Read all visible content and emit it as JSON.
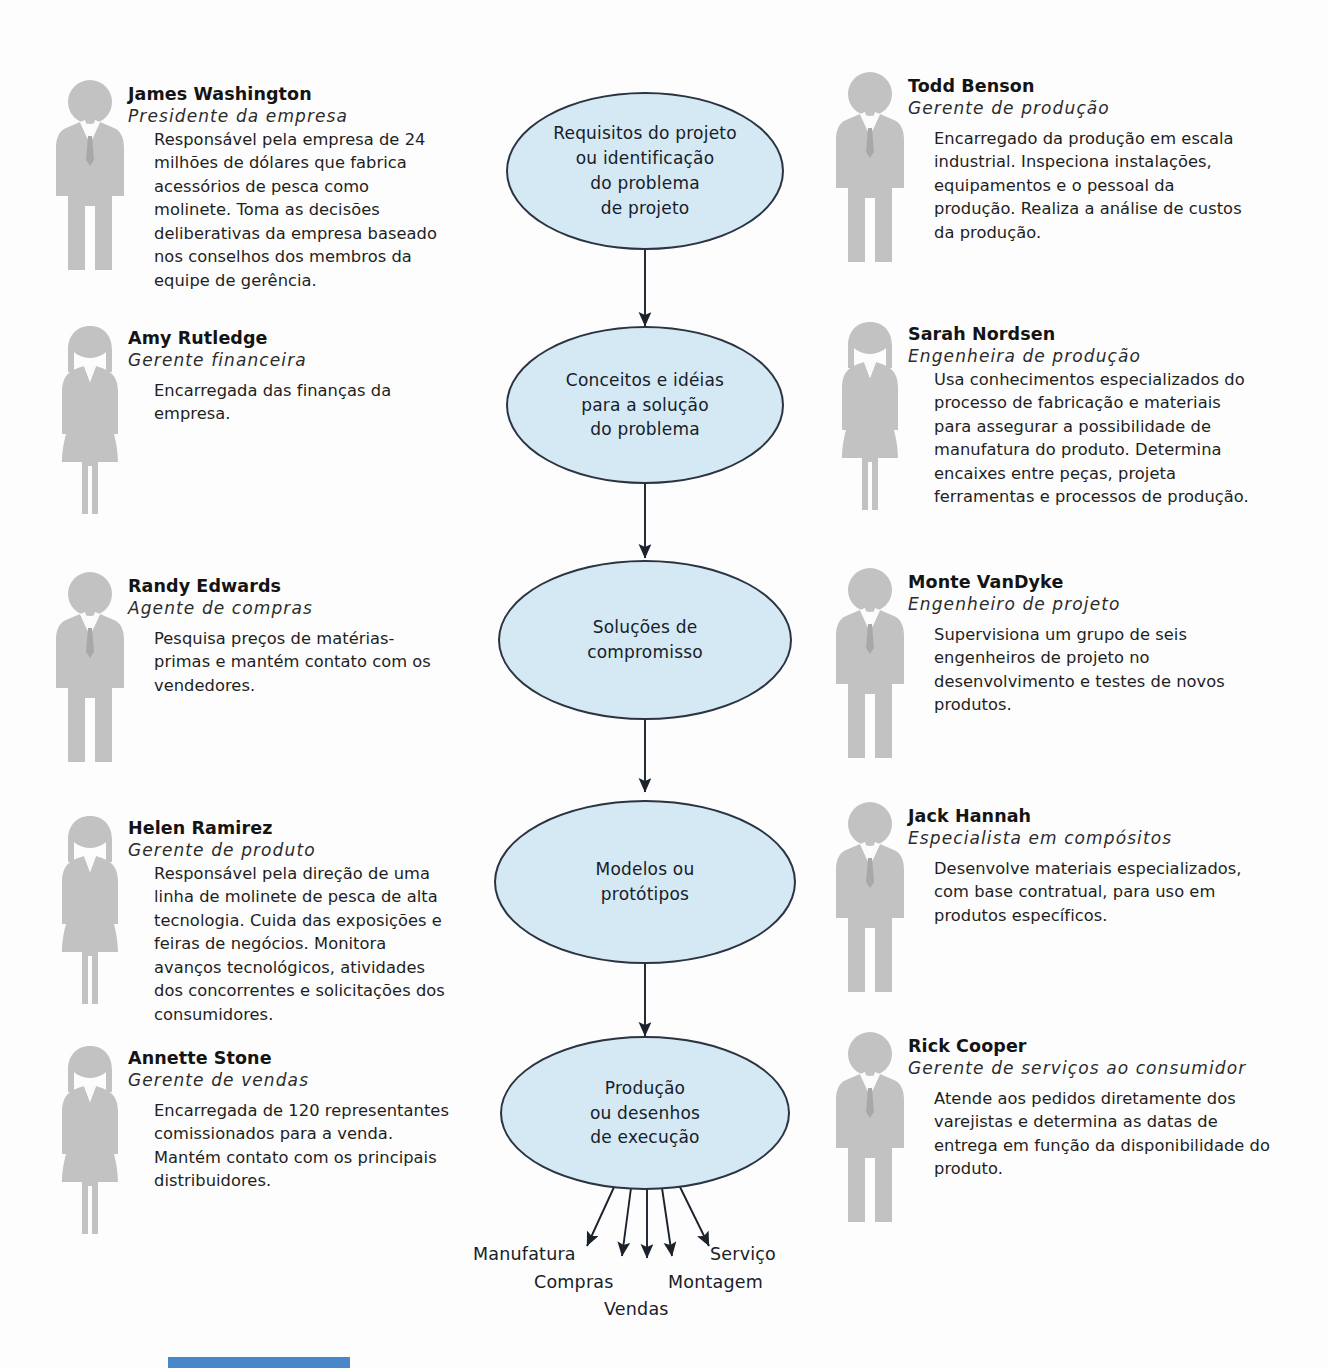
{
  "diagram": {
    "colors": {
      "ellipse_fill": "#d4e9f4",
      "ellipse_stroke": "#2b3440",
      "figure_gray": "#c2c2c2",
      "text": "#18202a",
      "scan_bar": "#4a87c8"
    }
  },
  "flow": {
    "nodes": [
      {
        "id": "requisitos",
        "label": "Requisitos do projeto\nou identificação\ndo problema\nde projeto"
      },
      {
        "id": "conceitos",
        "label": "Conceitos e idéias\npara a solução\ndo problema"
      },
      {
        "id": "solucoes",
        "label": "Soluções de\ncompromisso"
      },
      {
        "id": "modelos",
        "label": "Modelos ou\nprotótipos"
      },
      {
        "id": "producao",
        "label": "Produção\nou desenhos\nde execução"
      }
    ],
    "outputs": [
      {
        "id": "manufatura",
        "label": "Manufatura"
      },
      {
        "id": "compras",
        "label": "Compras"
      },
      {
        "id": "vendas",
        "label": "Vendas"
      },
      {
        "id": "montagem",
        "label": "Montagem"
      },
      {
        "id": "servico",
        "label": "Serviço"
      }
    ]
  },
  "left_column": [
    {
      "id": "james-washington",
      "name": "James Washington",
      "role": "Presidente da empresa",
      "figure": "male-figure",
      "description": "Responsável pela empresa de 24 milhões de dólares que fabrica acessórios de pesca como molinete. Toma as decisões deliberativas da empresa baseado nos conselhos dos membros da equipe de gerência."
    },
    {
      "id": "amy-rutledge",
      "name": "Amy Rutledge",
      "role": "Gerente financeira",
      "figure": "female-figure",
      "description": "Encarregada das finanças da empresa."
    },
    {
      "id": "randy-edwards",
      "name": "Randy Edwards",
      "role": "Agente de compras",
      "figure": "male-figure",
      "description": "Pesquisa preços de matérias-primas e mantém contato com os vendedores."
    },
    {
      "id": "helen-ramirez",
      "name": "Helen Ramirez",
      "role": "Gerente de produto",
      "figure": "female-figure",
      "description": "Responsável pela direção de uma linha de molinete de pesca de alta tecnologia. Cuida das exposições e feiras de negócios. Monitora avanços tecnológicos, atividades dos concorrentes e solicitações dos consumidores."
    },
    {
      "id": "annette-stone",
      "name": "Annette Stone",
      "role": "Gerente de vendas",
      "figure": "female-figure",
      "description": "Encarregada de 120 representantes comissionados para a venda. Mantém contato com os principais distribuidores."
    }
  ],
  "right_column": [
    {
      "id": "todd-benson",
      "name": "Todd Benson",
      "role": "Gerente de produção",
      "figure": "male-figure",
      "description": "Encarregado da produção em escala industrial. Inspeciona instalações, equipamentos e o pessoal da produção. Realiza a análise de custos da produção."
    },
    {
      "id": "sarah-nordsen",
      "name": "Sarah Nordsen",
      "role": "Engenheira de produção",
      "figure": "female-figure",
      "description": "Usa conhecimentos especializados do processo de fabricação e materiais para assegurar a possibilidade de manufatura do produto. Determina encaixes entre peças, projeta ferramentas e processos de produção."
    },
    {
      "id": "monte-vandyke",
      "name": "Monte VanDyke",
      "role": "Engenheiro de projeto",
      "figure": "male-figure",
      "description": "Supervisiona um grupo de seis engenheiros de projeto no desenvolvimento e testes de novos produtos."
    },
    {
      "id": "jack-hannah",
      "name": "Jack Hannah",
      "role": "Especialista em compósitos",
      "figure": "male-figure",
      "description": "Desenvolve materiais especializados, com base contratual, para uso em produtos específicos."
    },
    {
      "id": "rick-cooper",
      "name": "Rick Cooper",
      "role": "Gerente de serviços ao consumidor",
      "figure": "male-figure",
      "description": "Atende aos pedidos diretamente dos varejistas e determina as datas de entrega em função da disponibilidade do produto."
    }
  ]
}
